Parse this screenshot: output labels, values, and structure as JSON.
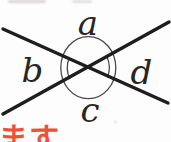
{
  "diagram": {
    "type": "vertical-angles-two-crossing-lines",
    "angle_labels": {
      "top": "a",
      "left": "b",
      "bottom": "c",
      "right": "d"
    },
    "angle_marks": {
      "full_circle_around_intersection": true,
      "double_arc_on_left_angle_b": true,
      "double_arc_on_right_angle_d": true
    },
    "colors": {
      "line": "#1e1e1e",
      "arc": "#4a4a4a",
      "label": "#262626",
      "cropped_text": "#ee5038",
      "background": "#fdfdfd"
    }
  },
  "cropped_text": {
    "bottom_left": "ます"
  }
}
